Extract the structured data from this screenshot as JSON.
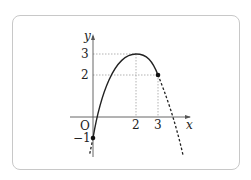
{
  "diagram": {
    "title": "",
    "axes": {
      "x_label": "x",
      "y_label": "y",
      "origin_label": "O"
    },
    "ticks": {
      "x": [
        {
          "value": 2,
          "label": "2"
        },
        {
          "value": 3,
          "label": "3"
        }
      ],
      "y": [
        {
          "value": 3,
          "label": "3"
        },
        {
          "value": 2,
          "label": "2"
        },
        {
          "value": -1,
          "label": "−1"
        }
      ]
    },
    "curve": {
      "equation": "y = -(x-2)^2 + 3",
      "vertex": [
        2,
        3
      ],
      "solid_domain": [
        0,
        3
      ],
      "dashed_left": true,
      "dashed_right": true
    },
    "points": [
      {
        "x": 0,
        "y": -1,
        "filled": true
      },
      {
        "x": 3,
        "y": 2,
        "filled": true
      }
    ],
    "guide_lines": [
      {
        "from": [
          0,
          3
        ],
        "to": [
          2,
          3
        ]
      },
      {
        "from": [
          2,
          3
        ],
        "to": [
          2,
          0
        ]
      },
      {
        "from": [
          0,
          2
        ],
        "to": [
          3,
          2
        ]
      },
      {
        "from": [
          3,
          2
        ],
        "to": [
          3,
          0
        ]
      }
    ],
    "colors": {
      "curve": "#222222",
      "axis": "#555555",
      "guide": "#999999",
      "frame": "#c8c8c8"
    }
  }
}
